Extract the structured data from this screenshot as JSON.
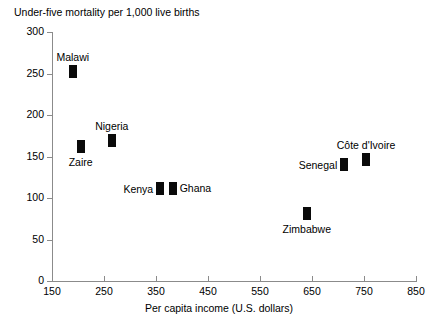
{
  "chart_data": {
    "type": "scatter",
    "title": "Under-five mortality per 1,000 live births",
    "xlabel": "Per capita income (U.S. dollars)",
    "ylabel": "Under-five mortality per 1,000 live births",
    "xlim": [
      150,
      850
    ],
    "ylim": [
      0,
      300
    ],
    "xticks": [
      "150",
      "250",
      "350",
      "450",
      "550",
      "650",
      "750",
      "850"
    ],
    "yticks": [
      "0",
      "50",
      "100",
      "150",
      "200",
      "250",
      "300"
    ],
    "grid": false,
    "legend": "none",
    "marker_color": "#0a0a0a",
    "axis_color": "#8b8b8b",
    "points": [
      {
        "name": "Malawi",
        "x": 190,
        "y": 252,
        "label_pos": "above"
      },
      {
        "name": "Zaire",
        "x": 205,
        "y": 162,
        "label_pos": "below"
      },
      {
        "name": "Nigeria",
        "x": 265,
        "y": 169,
        "label_pos": "above"
      },
      {
        "name": "Kenya",
        "x": 358,
        "y": 111,
        "label_pos": "left"
      },
      {
        "name": "Ghana",
        "x": 382,
        "y": 112,
        "label_pos": "right"
      },
      {
        "name": "Zimbabwe",
        "x": 640,
        "y": 81,
        "label_pos": "below"
      },
      {
        "name": "Senegal",
        "x": 712,
        "y": 140,
        "label_pos": "left"
      },
      {
        "name": "Côte d'Ivoire",
        "x": 754,
        "y": 146,
        "label_pos": "above"
      }
    ]
  }
}
